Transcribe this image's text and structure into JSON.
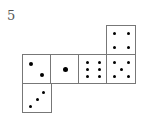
{
  "label": "5",
  "faces": [
    {
      "name": "face-two",
      "pips": 2,
      "x": 22,
      "y": 54
    },
    {
      "name": "face-one",
      "pips": 1,
      "x": 50,
      "y": 54
    },
    {
      "name": "face-six",
      "pips": 6,
      "x": 78,
      "y": 54
    },
    {
      "name": "face-five",
      "pips": 5,
      "x": 106,
      "y": 54
    },
    {
      "name": "face-four",
      "pips": 4,
      "x": 106,
      "y": 25
    },
    {
      "name": "face-three",
      "pips": 3,
      "x": 22,
      "y": 83
    }
  ]
}
